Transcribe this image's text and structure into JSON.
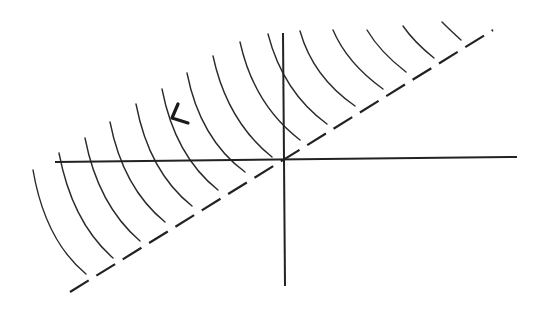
{
  "diagram": {
    "colors": {
      "background": "#ffffff",
      "stroke": "#222222"
    },
    "axes": {
      "horizontal": {
        "x1": 55,
        "y1": 162,
        "x2": 517,
        "y2": 157
      },
      "vertical": {
        "x1": 283,
        "y1": 33,
        "x2": 285,
        "y2": 286
      }
    },
    "dashed_boundary": {
      "x1": 70,
      "y1": 292,
      "x2": 493,
      "y2": 30
    },
    "wavefronts": [
      {
        "x1": 33,
        "y1": 170,
        "cx": 45,
        "cy": 240,
        "x2": 86,
        "y2": 274
      },
      {
        "x1": 59,
        "y1": 153,
        "cx": 72,
        "cy": 222,
        "x2": 113,
        "y2": 258
      },
      {
        "x1": 85,
        "y1": 138,
        "cx": 98,
        "cy": 205,
        "x2": 140,
        "y2": 241
      },
      {
        "x1": 110,
        "y1": 122,
        "cx": 123,
        "cy": 188,
        "x2": 165,
        "y2": 222
      },
      {
        "x1": 136,
        "y1": 104,
        "cx": 149,
        "cy": 172,
        "x2": 192,
        "y2": 206
      },
      {
        "x1": 162,
        "y1": 89,
        "cx": 175,
        "cy": 156,
        "x2": 218,
        "y2": 190
      },
      {
        "x1": 187,
        "y1": 73,
        "cx": 200,
        "cy": 139,
        "x2": 245,
        "y2": 172
      },
      {
        "x1": 213,
        "y1": 56,
        "cx": 227,
        "cy": 121,
        "x2": 272,
        "y2": 157
      },
      {
        "x1": 240,
        "y1": 42,
        "cx": 254,
        "cy": 105,
        "x2": 300,
        "y2": 140
      },
      {
        "x1": 268,
        "y1": 34,
        "cx": 283,
        "cy": 92,
        "x2": 327,
        "y2": 124
      },
      {
        "x1": 300,
        "y1": 31,
        "cx": 313,
        "cy": 77,
        "x2": 355,
        "y2": 106
      },
      {
        "x1": 333,
        "y1": 30,
        "cx": 347,
        "cy": 63,
        "x2": 383,
        "y2": 89
      },
      {
        "x1": 367,
        "y1": 30,
        "cx": 380,
        "cy": 52,
        "x2": 406,
        "y2": 72
      },
      {
        "x1": 403,
        "y1": 26,
        "cx": 414,
        "cy": 42,
        "x2": 434,
        "y2": 58
      },
      {
        "x1": 442,
        "y1": 22,
        "cx": 450,
        "cy": 30,
        "x2": 461,
        "y2": 40
      }
    ],
    "direction_marker": {
      "icon": "chevron-left-arrow",
      "points": [
        [
          178,
          104
        ],
        [
          172,
          118
        ],
        [
          188,
          123
        ]
      ]
    }
  }
}
